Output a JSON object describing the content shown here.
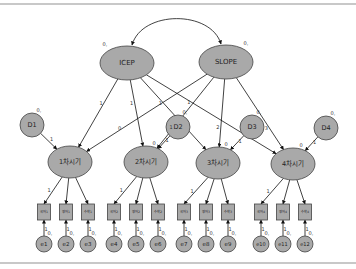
{
  "diagram": {
    "type": "SEM latent growth curve model path diagram",
    "colors": {
      "node_fill": "#a9a9a9",
      "node_stroke": "#444444",
      "line": "#111111",
      "background": "#ffffff",
      "rule": "#c8c8c8"
    },
    "growth_factors": [
      {
        "id": "icep",
        "label": "ICEP",
        "variance_label": "0,",
        "cx": 127,
        "cy": 63
      },
      {
        "id": "slope",
        "label": "SLOPE",
        "variance_label": "0,",
        "cx": 226,
        "cy": 62
      }
    ],
    "covariance": {
      "from": "icep",
      "to": "slope"
    },
    "disturbances": [
      {
        "id": "d1",
        "label": "D1",
        "variance_label": "0,",
        "cx": 32,
        "cy": 125,
        "path_label": "1"
      },
      {
        "id": "d2",
        "label": "D2",
        "variance_label": "0,",
        "cx": 178,
        "cy": 127,
        "path_label": "1"
      },
      {
        "id": "d3",
        "label": "D3",
        "variance_label": "0,",
        "cx": 252,
        "cy": 127,
        "path_label": "1"
      },
      {
        "id": "d4",
        "label": "D4",
        "variance_label": "0,",
        "cx": 326,
        "cy": 128,
        "path_label": "1"
      }
    ],
    "time_points": [
      {
        "id": "t1",
        "label": "1차시기",
        "intercept_label": "",
        "cx": 70,
        "cy": 162
      },
      {
        "id": "t2",
        "label": "2차시기",
        "intercept_label": "0",
        "cx": 146,
        "cy": 162
      },
      {
        "id": "t3",
        "label": "3차시기",
        "intercept_label": "0",
        "cx": 218,
        "cy": 163
      },
      {
        "id": "t4",
        "label": "4차시기",
        "intercept_label": "0",
        "cx": 293,
        "cy": 164
      }
    ],
    "icep_loadings": [
      "1",
      "1",
      "1",
      "1"
    ],
    "slope_loadings": [
      "0",
      "1",
      "2",
      "3"
    ],
    "indicators": [
      {
        "label": "국어1",
        "cx": 44,
        "time": 0,
        "loading": "1"
      },
      {
        "label": "영어1",
        "cx": 66,
        "time": 0,
        "loading": ""
      },
      {
        "label": "수학1",
        "cx": 88,
        "time": 0,
        "loading": ""
      },
      {
        "label": "국어2",
        "cx": 114,
        "time": 1,
        "loading": "1"
      },
      {
        "label": "영어2",
        "cx": 136,
        "time": 1,
        "loading": ""
      },
      {
        "label": "수학2",
        "cx": 158,
        "time": 1,
        "loading": ""
      },
      {
        "label": "국어3",
        "cx": 184,
        "time": 2,
        "loading": "1"
      },
      {
        "label": "영어3",
        "cx": 206,
        "time": 2,
        "loading": ""
      },
      {
        "label": "수학3",
        "cx": 228,
        "time": 2,
        "loading": ""
      },
      {
        "label": "국어4",
        "cx": 261,
        "time": 3,
        "loading": "1"
      },
      {
        "label": "영어4",
        "cx": 283,
        "time": 3,
        "loading": ""
      },
      {
        "label": "수학4",
        "cx": 305,
        "time": 3,
        "loading": ""
      }
    ],
    "errors": [
      {
        "label": "e1",
        "variance_label": "0,",
        "path_label": "1"
      },
      {
        "label": "e2",
        "variance_label": "0,",
        "path_label": "1"
      },
      {
        "label": "e3",
        "variance_label": "0,",
        "path_label": "1"
      },
      {
        "label": "e4",
        "variance_label": "0,",
        "path_label": "1"
      },
      {
        "label": "e5",
        "variance_label": "0,",
        "path_label": "1"
      },
      {
        "label": "e6",
        "variance_label": "0,",
        "path_label": "1"
      },
      {
        "label": "e7",
        "variance_label": "0,",
        "path_label": "1"
      },
      {
        "label": "e8",
        "variance_label": "0,",
        "path_label": "1"
      },
      {
        "label": "e9",
        "variance_label": "0,",
        "path_label": "1"
      },
      {
        "label": "e10",
        "variance_label": "0,",
        "path_label": "1"
      },
      {
        "label": "e11",
        "variance_label": "0,",
        "path_label": "1"
      },
      {
        "label": "e12",
        "variance_label": "0,",
        "path_label": "1"
      }
    ]
  }
}
